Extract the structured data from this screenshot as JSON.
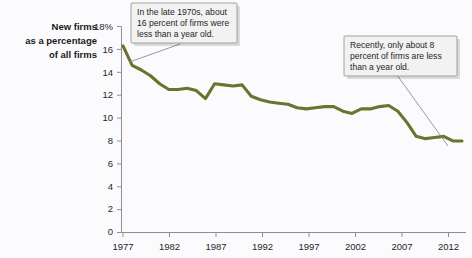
{
  "chart_data": {
    "type": "line",
    "title": "",
    "ylabel": "New firms as a percentage of all firms",
    "xlabel": "",
    "ylim": [
      0,
      18
    ],
    "xlim": [
      1977,
      2014
    ],
    "ytick_labels": [
      "0",
      "2",
      "4",
      "6",
      "8",
      "10",
      "12",
      "14",
      "16",
      "18%"
    ],
    "yticks": [
      0,
      2,
      4,
      6,
      8,
      10,
      12,
      14,
      16,
      18
    ],
    "xtick_labels": [
      "1977",
      "1982",
      "1987",
      "1992",
      "1997",
      "2002",
      "2007",
      "2012"
    ],
    "xticks": [
      1977,
      1982,
      1987,
      1992,
      1997,
      2002,
      2007,
      2012
    ],
    "grid": false,
    "legend": "none",
    "line_color": "#6d722f",
    "series": [
      {
        "name": "New firms as a percentage of all firms",
        "x": [
          1977,
          1978,
          1979,
          1980,
          1981,
          1982,
          1983,
          1984,
          1985,
          1986,
          1987,
          1988,
          1989,
          1990,
          1991,
          1992,
          1993,
          1994,
          1995,
          1996,
          1997,
          1998,
          1999,
          2000,
          2001,
          2002,
          2003,
          2004,
          2005,
          2006,
          2007,
          2008,
          2009,
          2010,
          2011,
          2012,
          2013,
          2014
        ],
        "values": [
          16.3,
          14.6,
          14.2,
          13.7,
          13.0,
          12.5,
          12.5,
          12.6,
          12.4,
          11.7,
          13.0,
          12.9,
          12.8,
          12.9,
          11.9,
          11.6,
          11.4,
          11.3,
          11.2,
          10.9,
          10.8,
          10.9,
          11.0,
          11.0,
          10.6,
          10.4,
          10.8,
          10.8,
          11.0,
          11.1,
          10.6,
          9.6,
          8.4,
          8.2,
          8.3,
          8.4,
          8.0,
          8.0
        ]
      }
    ],
    "annotations": [
      {
        "name": "late-1970s-callout",
        "text": "In the late 1970s, about 16 percent of firms were less than a year old.",
        "lines": [
          "In the late 1970s, about",
          "16 percent of firms were",
          "less than a year old."
        ],
        "points_to_year": 1978,
        "points_to_value": 15.2
      },
      {
        "name": "recent-callout",
        "text": "Recently, only about 8 percent of firms are less than a year old.",
        "lines": [
          "Recently, only about 8",
          "percent of firms are less",
          "than a year old."
        ],
        "points_to_year": 2014,
        "points_to_value": 8.0
      }
    ]
  },
  "ylabel_lines": [
    "New firms",
    "as a percentage",
    "of all firms"
  ]
}
